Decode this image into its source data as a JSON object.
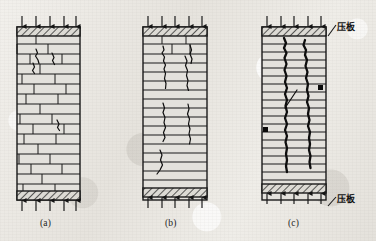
{
  "figure": {
    "type": "engineering-diagram",
    "background": "#eceae5",
    "ink": "#1a1a1a"
  },
  "panels": [
    {
      "id": "a",
      "caption": "(a)",
      "caption_x": 40,
      "caption_y": 218,
      "stage": "initial-cracking",
      "wall": {
        "x": 17,
        "y": 27,
        "w": 63,
        "h": 173
      },
      "plate_top": {
        "x": 17,
        "y": 27,
        "w": 63,
        "h": 9
      },
      "plate_bottom": {
        "x": 17,
        "y": 191,
        "w": 63,
        "h": 9
      },
      "arrows_top": [
        22,
        36,
        50,
        64,
        76
      ],
      "arrows_bottom": [
        22,
        36,
        50,
        64,
        76
      ],
      "courses": [
        44,
        54,
        64,
        74,
        84,
        94,
        104,
        114,
        124,
        134,
        144,
        154,
        164,
        174,
        184
      ],
      "head_joints": [
        [
          36,
          36,
          44
        ],
        [
          17,
          44,
          54
        ],
        [
          48,
          44,
          54
        ],
        [
          30,
          54,
          64
        ],
        [
          62,
          54,
          64
        ],
        [
          40,
          64,
          74
        ],
        [
          22,
          74,
          84
        ],
        [
          55,
          74,
          84
        ],
        [
          34,
          84,
          94
        ],
        [
          66,
          84,
          94
        ],
        [
          26,
          94,
          104
        ],
        [
          58,
          94,
          104
        ],
        [
          40,
          104,
          114
        ],
        [
          20,
          114,
          124
        ],
        [
          52,
          114,
          124
        ],
        [
          33,
          124,
          134
        ],
        [
          64,
          124,
          134
        ],
        [
          24,
          134,
          144
        ],
        [
          56,
          134,
          144
        ],
        [
          38,
          144,
          154
        ],
        [
          19,
          154,
          164
        ],
        [
          50,
          154,
          164
        ],
        [
          31,
          164,
          174
        ],
        [
          62,
          164,
          174
        ],
        [
          42,
          174,
          184
        ],
        [
          23,
          184,
          191
        ],
        [
          55,
          184,
          191
        ]
      ],
      "cracks": [
        "M 36,49 l 1.5,4 l -2,3 l 2.5,4 l 1,3.5",
        "M 52,53 l 2,4.5 l -1.5,3 l 2,4",
        "M 33,63 l 1.5,4 l -2,3.5 l 2,3",
        "M 57,120 l 2,4 l -1.5,3.5 l 2,3"
      ]
    },
    {
      "id": "b",
      "caption": "(b)",
      "caption_x": 165,
      "caption_y": 218,
      "stage": "crack-propagation",
      "wall": {
        "x": 143,
        "y": 27,
        "w": 64,
        "h": 173
      },
      "plate_top": {
        "x": 143,
        "y": 27,
        "w": 64,
        "h": 9
      },
      "plate_bottom": {
        "x": 143,
        "y": 188,
        "w": 64,
        "h": 9
      },
      "arrows_top": [
        148,
        162,
        175,
        189,
        202
      ],
      "arrows_bottom": [
        148,
        162,
        175,
        189,
        202
      ],
      "courses": [
        44,
        54,
        63,
        72,
        81,
        90,
        99,
        108,
        117,
        126,
        135,
        144,
        153,
        162,
        171,
        180
      ],
      "head_joints": [
        [
          162,
          36,
          44
        ],
        [
          186,
          36,
          44
        ],
        [
          172,
          44,
          54
        ],
        [
          190,
          44,
          54
        ]
      ],
      "cracks": [
        "M 163,46 l 1,4 l -2,3 l 2.5,4 l -1,4 l 2,4 l -1.5,4 l 1.5,4.5 l -1,5 l 1.5,5 l -0.5,5",
        "M 190,45 l 1.5,5 l -1.5,4 l 2,5 l -1,4.5",
        "M 185,56 l 2,5 l -1.5,4.5 l 2,5 l -1,5 l 1.5,5 l -1,5 l 1.5,5",
        "M 163,103 l 1.5,5 l -1.5,4.5 l 2,5 l -1,5 l 1.5,5 l -2,5 l 1.5,5 l -2,4",
        "M 188,104 l 1,5 l -1.5,5 l 2,5 l -1,5 l 1.5,5 l -1,5 l 1.5,5 l -1,5",
        "M 160,150 l 2,5 l -1.5,5 l 2,5 l -2.5,5 l -3,4"
      ]
    },
    {
      "id": "c",
      "caption": "(c)",
      "caption_x": 288,
      "caption_y": 218,
      "stage": "failure",
      "wall": {
        "x": 262,
        "y": 27,
        "w": 64,
        "h": 173
      },
      "plate_top": {
        "x": 262,
        "y": 27,
        "w": 64,
        "h": 9
      },
      "plate_bottom": {
        "x": 262,
        "y": 184,
        "w": 64,
        "h": 9
      },
      "arrows_top": [
        267,
        281,
        294,
        308,
        321
      ],
      "arrows_bottom": [
        267,
        281,
        294,
        308,
        321
      ],
      "courses": [
        44,
        52,
        60,
        68,
        76,
        84,
        92,
        100,
        108,
        116,
        124,
        132,
        140,
        148,
        156,
        164,
        172,
        180
      ],
      "head_joints": [],
      "markers": [
        {
          "x": 318,
          "y": 85,
          "w": 5,
          "h": 5
        },
        {
          "x": 263,
          "y": 127,
          "w": 5,
          "h": 5
        }
      ],
      "cracks": [
        "M 284,38 l 2,5 l -2,5 l 2.5,5 l -2,5 l 2,6 l -2,6 l 2,6 l -1.5,6 l 2,6 l -2,6 l 2,6 l -1.5,6 l 1.5,6 l -2,6 l 2,6 l -2,6 l 2,6 l -1.5,6 l 1.5,6 l -1,6 l 1,6 l -1,6 l 1,6",
        "M 305,40 l -1.5,5 l 2.5,5 l -1,5 l 2,5 l -1.5,6 l 2,6 l -1.5,6 l 2,6 l -1,6 l 1.5,6 l -1.5,6 l 2,6 l -1,6 l 1.5,6 l -1.5,6 l 2,6 l -1,6 l 1,6 l -1,6 l 1.5,6 l -1,6 l 1,6",
        "M 297,90 l -4,6 l -4,6 l -4,6"
      ]
    }
  ],
  "annotations": [
    {
      "id": "plate-top-label",
      "text": "压板",
      "x": 337,
      "y": 20,
      "leader": {
        "x1": 328,
        "y1": 36,
        "x2": 336,
        "y2": 25
      }
    },
    {
      "id": "plate-bottom-label",
      "text": "压板",
      "x": 337,
      "y": 192,
      "leader": {
        "x1": 328,
        "y1": 206,
        "x2": 336,
        "y2": 197
      }
    }
  ]
}
